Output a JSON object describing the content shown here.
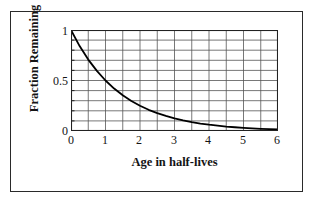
{
  "figure": {
    "has_outer_border": true,
    "border_color": "#2a2a2a",
    "background_color": "#ffffff"
  },
  "chart_data": {
    "type": "line",
    "title": "",
    "subtitle": "",
    "xlabel": "Age in half-lives",
    "ylabel": "Fraction Remaining",
    "xlim": [
      0,
      6
    ],
    "ylim": [
      0,
      1
    ],
    "xticks": [
      0,
      1,
      2,
      3,
      4,
      5,
      6
    ],
    "xtick_labels": [
      "0",
      "1",
      "2",
      "3",
      "4",
      "5",
      "6"
    ],
    "yticks": [
      0,
      0.5,
      1
    ],
    "ytick_labels": [
      "0",
      "0.5",
      "1"
    ],
    "y_minor_ticks": [
      0.1,
      0.2,
      0.3,
      0.4,
      0.6,
      0.7,
      0.8,
      0.9
    ],
    "grid": true,
    "grid_x_step": 0.5,
    "grid_y_step": 0.1,
    "grid_color": "#555555",
    "legend": null,
    "legend_position": "none",
    "series": [
      {
        "name": "Fraction Remaining",
        "color": "#000000",
        "line_width": 1.8,
        "x": [
          0,
          0.25,
          0.5,
          0.75,
          1,
          1.25,
          1.5,
          1.75,
          2,
          2.25,
          2.5,
          2.75,
          3,
          3.25,
          3.5,
          3.75,
          4,
          4.25,
          4.5,
          4.75,
          5,
          5.25,
          5.5,
          5.75,
          6
        ],
        "values": [
          1,
          0.841,
          0.707,
          0.595,
          0.5,
          0.42,
          0.354,
          0.297,
          0.25,
          0.21,
          0.177,
          0.149,
          0.125,
          0.105,
          0.088,
          0.074,
          0.0625,
          0.053,
          0.044,
          0.037,
          0.031,
          0.026,
          0.022,
          0.019,
          0.016
        ]
      }
    ],
    "annotations": []
  },
  "axis": {
    "x_title": "Age in half-lives",
    "y_title": "Fraction Remaining"
  }
}
